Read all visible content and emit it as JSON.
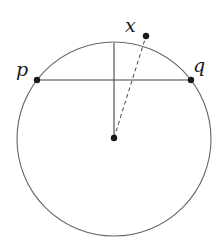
{
  "diagram": {
    "labels": {
      "p": "p",
      "q": "q",
      "x": "x"
    },
    "colors": {
      "stroke": "#555555",
      "point": "#1a1a1a"
    },
    "elements": [
      "circle",
      "chord p-q",
      "perpendicular from center to top of circle",
      "dashed segment from center to x"
    ]
  }
}
